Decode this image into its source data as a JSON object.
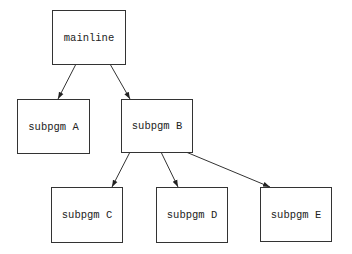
{
  "diagram": {
    "type": "call-tree",
    "nodes": [
      {
        "id": "mainline",
        "label": "mainline",
        "x": 52,
        "y": 10,
        "w": 74,
        "h": 55
      },
      {
        "id": "A",
        "label": "subpgm A",
        "x": 17,
        "y": 99,
        "w": 73,
        "h": 55
      },
      {
        "id": "B",
        "label": "subpgm B",
        "x": 121,
        "y": 99,
        "w": 72,
        "h": 54
      },
      {
        "id": "C",
        "label": "subpgm C",
        "x": 51,
        "y": 187,
        "w": 72,
        "h": 56
      },
      {
        "id": "D",
        "label": "subpgm D",
        "x": 156,
        "y": 187,
        "w": 72,
        "h": 56
      },
      {
        "id": "E",
        "label": "subpgm E",
        "x": 260,
        "y": 187,
        "w": 72,
        "h": 55
      }
    ],
    "edges": [
      {
        "from": "mainline",
        "to": "A"
      },
      {
        "from": "mainline",
        "to": "B"
      },
      {
        "from": "B",
        "to": "C"
      },
      {
        "from": "B",
        "to": "D"
      },
      {
        "from": "B",
        "to": "E"
      }
    ]
  }
}
